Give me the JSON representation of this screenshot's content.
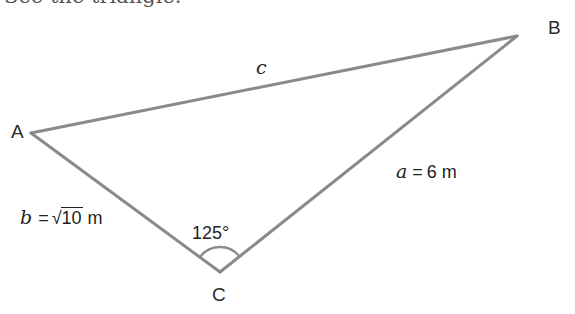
{
  "figure": {
    "kind": "triangle-diagram",
    "line_color": "#8a8a8a",
    "text_color": "#231f20",
    "background": "#ffffff",
    "stroke_width": 3,
    "vertices": [
      {
        "name": "A",
        "label": "A",
        "x": 31,
        "y": 133,
        "label_x": 11,
        "label_y": 124
      },
      {
        "name": "B",
        "label": "B",
        "x": 517,
        "y": 36,
        "label_x": 548,
        "label_y": 19
      },
      {
        "name": "C",
        "label": "C",
        "x": 220,
        "y": 272,
        "label_x": 212,
        "label_y": 287
      }
    ],
    "sides": [
      {
        "name": "side-c",
        "from": "A",
        "to": "B",
        "var": "c",
        "value": "",
        "unit": "",
        "full_label": "c",
        "label_x": 256,
        "label_y": 60
      },
      {
        "name": "side-a",
        "from": "C",
        "to": "B",
        "var": "a",
        "value": "6",
        "unit": "m",
        "full_label": "a = 6 m",
        "label_x": 396,
        "label_y": 163
      },
      {
        "name": "side-b",
        "from": "A",
        "to": "C",
        "var": "b",
        "value": "√10",
        "radicand": "10",
        "unit": "m",
        "full_label": "b = √10 m",
        "label_x": 20,
        "label_y": 209
      }
    ],
    "angles": [
      {
        "name": "angle-C",
        "at": "C",
        "label": "125°",
        "degrees": 125,
        "arc_radius": 25,
        "label_x": 192,
        "label_y": 225
      }
    ],
    "equals_sign": "=",
    "radical_sign": "√",
    "top_text_fragment": "See the triangle."
  }
}
